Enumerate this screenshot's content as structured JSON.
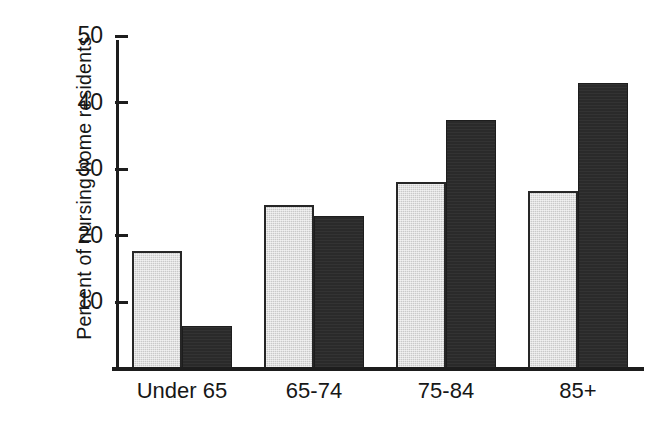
{
  "chart_data": {
    "type": "bar",
    "title": "",
    "subtitle": "",
    "xlabel": "",
    "ylabel": "Percent of nursing home residents",
    "categories": [
      "Under 65",
      "65-74",
      "75-84",
      "85+"
    ],
    "series": [
      {
        "name": "light-series",
        "color": "#c9c9c9",
        "values": [
          17.4,
          24.4,
          27.9,
          26.5
        ]
      },
      {
        "name": "dark-series",
        "color": "#2a2a2a",
        "values": [
          6.1,
          22.8,
          37.1,
          42.8
        ]
      }
    ],
    "yticks": [
      10,
      20,
      30,
      40,
      50
    ],
    "ytick_labels": [
      "10",
      "20",
      "30",
      "40",
      "50"
    ],
    "ylim": [
      0,
      50
    ],
    "grid": false,
    "legend": "none",
    "axis_color": "#1d1d1d"
  }
}
